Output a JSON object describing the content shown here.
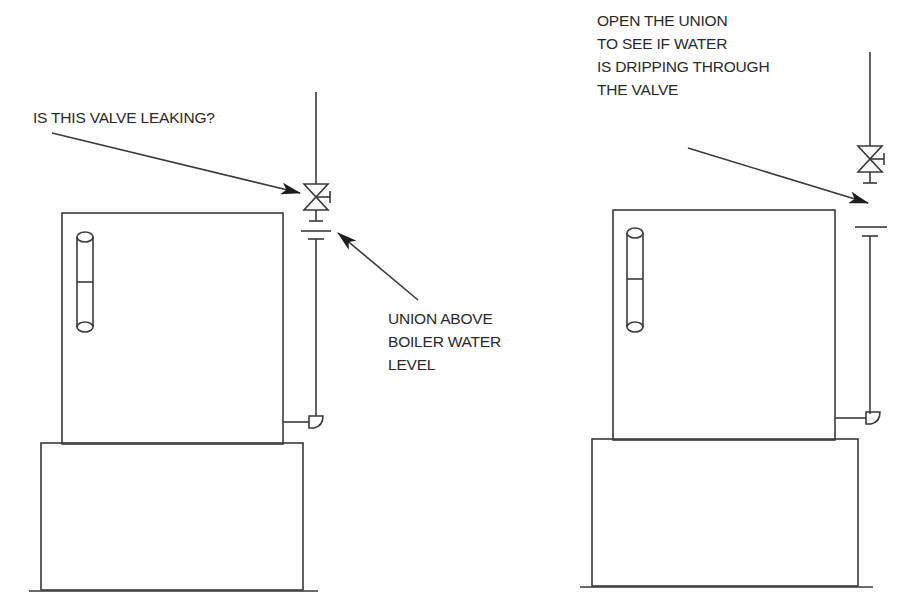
{
  "left_panel": {
    "callout_valve": "IS THIS VALVE LEAKING?",
    "callout_union": [
      "UNION ABOVE",
      "BOILER WATER",
      "LEVEL"
    ]
  },
  "right_panel": {
    "callout_open": [
      "OPEN THE UNION",
      "TO SEE IF WATER",
      "IS DRIPPING THROUGH",
      "THE VALVE"
    ]
  },
  "colors": {
    "line": "#3a3a3a",
    "text": "#2a2a2a",
    "background": "#ffffff"
  }
}
